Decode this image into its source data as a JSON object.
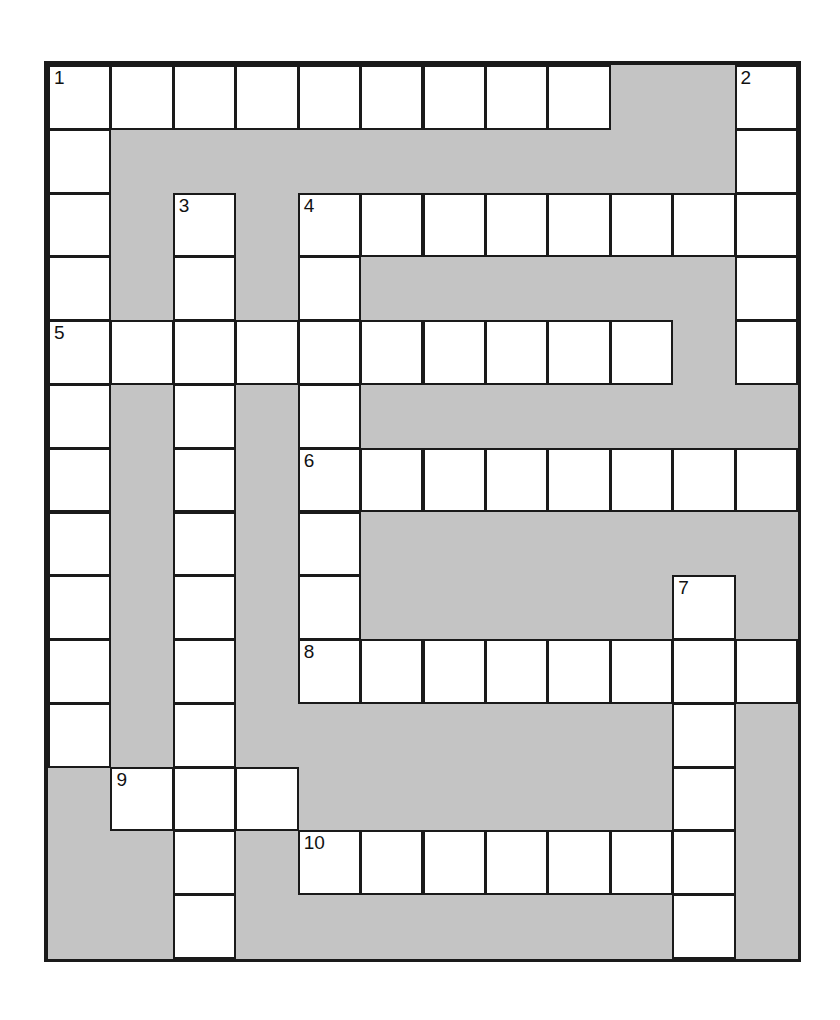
{
  "puzzle": {
    "type": "crossword-grid",
    "title": "Crossword Puzzle Grid",
    "columns": 12,
    "rows": 14,
    "cell_size_px": 63,
    "colors": {
      "block": "#c4c4c4",
      "light": "#ffffff",
      "border": "#1a1a1a",
      "number": "#111111",
      "page_background": "#ffffff"
    },
    "clue_numbers": [
      {
        "number": "1",
        "row": 0,
        "col": 0
      },
      {
        "number": "2",
        "row": 0,
        "col": 11
      },
      {
        "number": "3",
        "row": 2,
        "col": 2
      },
      {
        "number": "4",
        "row": 2,
        "col": 4
      },
      {
        "number": "5",
        "row": 4,
        "col": 0
      },
      {
        "number": "6",
        "row": 6,
        "col": 4
      },
      {
        "number": "7",
        "row": 8,
        "col": 10
      },
      {
        "number": "8",
        "row": 9,
        "col": 4
      },
      {
        "number": "9",
        "row": 11,
        "col": 1
      },
      {
        "number": "10",
        "row": 12,
        "col": 4
      }
    ],
    "entries": [
      {
        "number": "1",
        "direction": "across",
        "row": 0,
        "col": 0,
        "length": 9
      },
      {
        "number": "1",
        "direction": "down",
        "row": 0,
        "col": 0,
        "length": 11
      },
      {
        "number": "2",
        "direction": "down",
        "row": 0,
        "col": 11,
        "length": 5
      },
      {
        "number": "3",
        "direction": "down",
        "row": 2,
        "col": 2,
        "length": 12
      },
      {
        "number": "4",
        "direction": "across",
        "row": 2,
        "col": 4,
        "length": 8
      },
      {
        "number": "4",
        "direction": "down",
        "row": 2,
        "col": 4,
        "length": 8
      },
      {
        "number": "5",
        "direction": "across",
        "row": 4,
        "col": 0,
        "length": 10
      },
      {
        "number": "6",
        "direction": "across",
        "row": 6,
        "col": 4,
        "length": 8
      },
      {
        "number": "7",
        "direction": "down",
        "row": 8,
        "col": 10,
        "length": 6
      },
      {
        "number": "8",
        "direction": "across",
        "row": 9,
        "col": 4,
        "length": 8
      },
      {
        "number": "9",
        "direction": "across",
        "row": 11,
        "col": 1,
        "length": 3
      },
      {
        "number": "10",
        "direction": "across",
        "row": 12,
        "col": 4,
        "length": 7
      }
    ],
    "grid": [
      [
        "light",
        "light",
        "light",
        "light",
        "light",
        "light",
        "light",
        "light",
        "light",
        "block",
        "block",
        "light"
      ],
      [
        "light",
        "block",
        "block",
        "block",
        "block",
        "block",
        "block",
        "block",
        "block",
        "block",
        "block",
        "light"
      ],
      [
        "light",
        "block",
        "light",
        "block",
        "light",
        "light",
        "light",
        "light",
        "light",
        "light",
        "light",
        "light"
      ],
      [
        "light",
        "block",
        "light",
        "block",
        "light",
        "block",
        "block",
        "block",
        "block",
        "block",
        "block",
        "light"
      ],
      [
        "light",
        "light",
        "light",
        "light",
        "light",
        "light",
        "light",
        "light",
        "light",
        "light",
        "block",
        "light"
      ],
      [
        "light",
        "block",
        "light",
        "block",
        "light",
        "block",
        "block",
        "block",
        "block",
        "block",
        "block",
        "block"
      ],
      [
        "light",
        "block",
        "light",
        "block",
        "light",
        "light",
        "light",
        "light",
        "light",
        "light",
        "light",
        "light"
      ],
      [
        "light",
        "block",
        "light",
        "block",
        "light",
        "block",
        "block",
        "block",
        "block",
        "block",
        "block",
        "block"
      ],
      [
        "light",
        "block",
        "light",
        "block",
        "light",
        "block",
        "block",
        "block",
        "block",
        "block",
        "light",
        "block"
      ],
      [
        "light",
        "block",
        "light",
        "block",
        "light",
        "light",
        "light",
        "light",
        "light",
        "light",
        "light",
        "light"
      ],
      [
        "light",
        "block",
        "light",
        "block",
        "block",
        "block",
        "block",
        "block",
        "block",
        "block",
        "light",
        "block"
      ],
      [
        "block",
        "light",
        "light",
        "light",
        "block",
        "block",
        "block",
        "block",
        "block",
        "block",
        "light",
        "block"
      ],
      [
        "block",
        "block",
        "light",
        "block",
        "light",
        "light",
        "light",
        "light",
        "light",
        "light",
        "light",
        "block"
      ],
      [
        "block",
        "block",
        "light",
        "block",
        "block",
        "block",
        "block",
        "block",
        "block",
        "block",
        "light",
        "block"
      ]
    ]
  }
}
